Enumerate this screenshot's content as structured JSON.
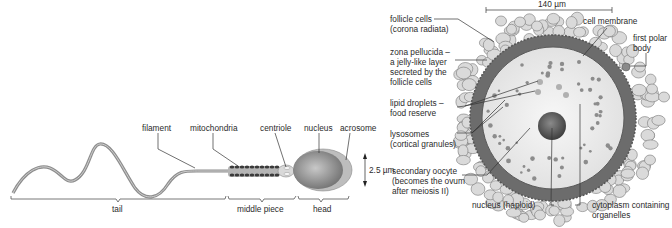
{
  "sperm": {
    "labels": {
      "filament": "filament",
      "mitochondria": "mitochondria",
      "centriole": "centriole",
      "nucleus": "nucleus",
      "acrosome": "acrosome"
    },
    "sections": {
      "tail": "tail",
      "middle_piece": "middle piece",
      "head": "head"
    },
    "scale": "2.5 µm"
  },
  "egg": {
    "scale": "140 µm",
    "labels": {
      "follicle_cells": [
        "follicle cells",
        "(corona radiata)"
      ],
      "zona_pellucida": [
        "zona pellucida –",
        "a jelly-like layer",
        "secreted by the",
        "follicle cells"
      ],
      "lipid_droplets": [
        "lipid droplets –",
        "food reserve"
      ],
      "lysosomes": [
        "lysosomes",
        "(cortical granules)"
      ],
      "secondary_oocyte": [
        "secondary oocyte",
        "(becomes the ovum",
        "after meiosis II)"
      ],
      "nucleus": "nucleus (haploid)",
      "cell_membrane": "cell membrane",
      "first_polar_body": [
        "first polar",
        "body"
      ],
      "cytoplasm": [
        "cytoplasm containing",
        "organelles"
      ]
    }
  },
  "colors": {
    "follicle_fill": "#d8d8d8",
    "zona": "#6e6e6e",
    "cytoplasm": "#efefef",
    "nucleus": "#555555",
    "sperm_body": "#9a9a9a"
  }
}
